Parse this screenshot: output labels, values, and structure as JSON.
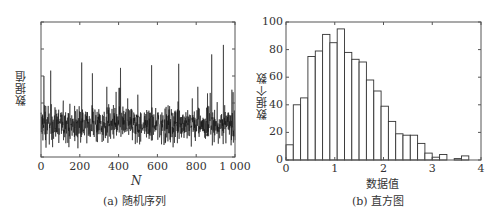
{
  "chart_data": [
    {
      "type": "line",
      "title": "",
      "caption": "(a)  随机序列",
      "xlabel": "N",
      "ylabel": "数据值",
      "xlim": [
        0,
        1000
      ],
      "ylim": [
        0,
        5
      ],
      "xticks": [
        "0",
        "200",
        "400",
        "600",
        "800",
        "1 000"
      ],
      "yticks": [
        "0",
        "1",
        "2",
        "3",
        "4",
        "5"
      ],
      "grid": false,
      "description": "1000-point random sequence, values mostly between 0 and 2.5, mean about 1.2, occasional spikes up to ~4.1",
      "notable_peaks": [
        {
          "x": 15,
          "y": 3.0
        },
        {
          "x": 50,
          "y": 3.2
        },
        {
          "x": 210,
          "y": 3.5
        },
        {
          "x": 265,
          "y": 3.1
        },
        {
          "x": 410,
          "y": 3.3
        },
        {
          "x": 570,
          "y": 3.4
        },
        {
          "x": 710,
          "y": 3.45
        },
        {
          "x": 880,
          "y": 3.8
        },
        {
          "x": 940,
          "y": 4.15
        },
        {
          "x": 990,
          "y": 2.4
        }
      ]
    },
    {
      "type": "bar",
      "title": "",
      "caption": "(b)  直方图",
      "xlabel": "数据值",
      "ylabel": "数据个数",
      "xlim": [
        0,
        4
      ],
      "ylim": [
        0,
        100
      ],
      "xticks": [
        "0",
        "1",
        "2",
        "3",
        "4"
      ],
      "yticks": [
        "0",
        "20",
        "40",
        "60",
        "80",
        "100"
      ],
      "grid": false,
      "bin_width": 0.15,
      "bin_starts": [
        0,
        0.15,
        0.3,
        0.45,
        0.6,
        0.75,
        0.9,
        1.05,
        1.2,
        1.35,
        1.5,
        1.65,
        1.8,
        1.95,
        2.1,
        2.25,
        2.4,
        2.55,
        2.7,
        2.85,
        3.0,
        3.15,
        3.3,
        3.45,
        3.6
      ],
      "values": [
        11,
        40,
        45,
        75,
        79,
        91,
        85,
        95,
        78,
        73,
        71,
        58,
        50,
        39,
        28,
        19,
        18,
        18,
        12,
        5,
        2,
        4,
        0,
        1,
        3
      ]
    }
  ]
}
